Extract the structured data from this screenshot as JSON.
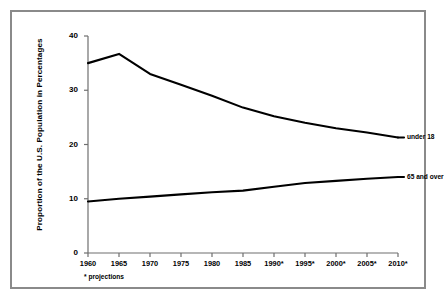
{
  "chart_data": {
    "type": "line",
    "title": "",
    "xlabel": "",
    "ylabel": "Proportion of the U.S. Population in Percentages",
    "categories": [
      "1960",
      "1965",
      "1970",
      "1975",
      "1980",
      "1985",
      "1990*",
      "1995*",
      "2000*",
      "2005*",
      "2010*"
    ],
    "x": [
      1960,
      1965,
      1970,
      1975,
      1980,
      1985,
      1990,
      1995,
      2000,
      2005,
      2010
    ],
    "xlim": [
      1960,
      2010
    ],
    "ylim": [
      0,
      40
    ],
    "yticks": [
      0,
      10,
      20,
      30,
      40
    ],
    "ytick_labels": [
      "0",
      "10",
      "20",
      "30",
      "40"
    ],
    "grid": false,
    "legend_position": "inline-right-of-line-ends",
    "line_color": "#000000",
    "series": [
      {
        "name": "under 18",
        "label": "under 18",
        "values": [
          35.0,
          36.7,
          33.0,
          31.0,
          29.0,
          26.8,
          25.2,
          24.0,
          23.0,
          22.2,
          21.3
        ]
      },
      {
        "name": "65 and over",
        "label": "65 and over",
        "values": [
          9.5,
          10.0,
          10.4,
          10.8,
          11.2,
          11.5,
          12.2,
          12.9,
          13.3,
          13.7,
          14.0
        ]
      }
    ],
    "annotations": [
      {
        "name": "projections-note",
        "text": "* projections"
      }
    ]
  },
  "figure": {
    "border_color": "#8a8a8a",
    "background": "#ffffff"
  }
}
